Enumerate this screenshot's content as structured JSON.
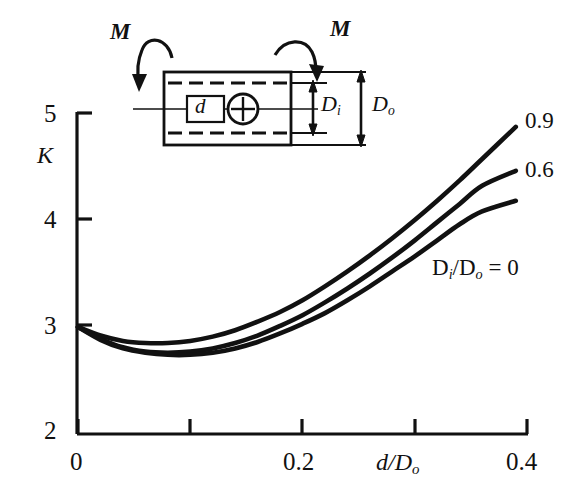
{
  "figure": {
    "title": "",
    "axis": {
      "y_label": "K",
      "x_label_num": "d",
      "x_label_den": "D",
      "x_label_den_sub": "o",
      "y_ticks": [
        "2",
        "3",
        "4",
        "5"
      ],
      "x_ticks": [
        "0",
        "0.2",
        "0.4"
      ]
    },
    "curve_labels": {
      "top": "0.9",
      "middle": "0.6",
      "bottom_prefix": "D",
      "bottom_sub1": "i",
      "bottom_slash": "/D",
      "bottom_sub2": "o",
      "bottom_eq": " = 0"
    },
    "inset": {
      "moment_left": "M",
      "moment_right": "M",
      "hole": "d",
      "inner_dim": "D",
      "inner_dim_sub": "i",
      "outer_dim": "D",
      "outer_dim_sub": "o"
    },
    "colors": {
      "ink": "#111111",
      "background": "#ffffff"
    }
  },
  "chart_data": {
    "type": "line",
    "title": "",
    "xlabel": "d/Do",
    "ylabel": "K",
    "xlim": [
      0,
      0.4
    ],
    "ylim": [
      2,
      5
    ],
    "xticks": [
      0,
      0.2,
      0.4
    ],
    "xticks_minor": [
      0.1,
      0.3
    ],
    "yticks": [
      2,
      3,
      4,
      5
    ],
    "grid": false,
    "legend": "inline-right-of-curve-ends",
    "x": [
      0.0,
      0.02,
      0.04,
      0.06,
      0.08,
      0.1,
      0.12,
      0.14,
      0.16,
      0.18,
      0.2,
      0.22,
      0.24,
      0.26,
      0.28,
      0.3,
      0.32,
      0.34,
      0.36,
      0.39
    ],
    "series": [
      {
        "name": "0.9",
        "label": "0.9",
        "values": [
          3.0,
          2.92,
          2.87,
          2.85,
          2.85,
          2.87,
          2.91,
          2.97,
          3.05,
          3.14,
          3.25,
          3.38,
          3.52,
          3.67,
          3.83,
          4.0,
          4.18,
          4.37,
          4.57,
          4.87
        ]
      },
      {
        "name": "0.6",
        "label": "0.6",
        "values": [
          3.0,
          2.89,
          2.81,
          2.77,
          2.76,
          2.77,
          2.8,
          2.85,
          2.92,
          3.01,
          3.11,
          3.23,
          3.36,
          3.5,
          3.65,
          3.81,
          3.98,
          4.15,
          4.32,
          4.46
        ]
      },
      {
        "name": "0",
        "label": "Di/Do = 0",
        "values": [
          3.0,
          2.88,
          2.8,
          2.76,
          2.74,
          2.74,
          2.76,
          2.8,
          2.86,
          2.94,
          3.03,
          3.13,
          3.25,
          3.38,
          3.52,
          3.66,
          3.81,
          3.96,
          4.08,
          4.18
        ]
      }
    ]
  }
}
